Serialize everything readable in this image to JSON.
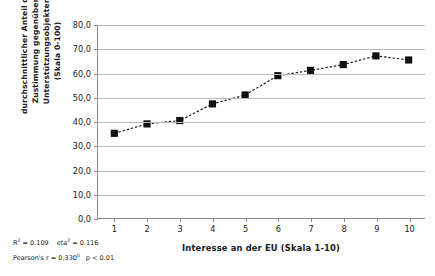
{
  "chart_data": {
    "type": "line",
    "title": "",
    "subtitle": "",
    "xlabel": "Interesse an der EU (Skala 1-10)",
    "ylabel": "durchschnittlicher Anteil der Zustimmung gegenüber Unterstützungsobjekten (Skala 0-100)",
    "ylabel_lines": [
      "durchschnittlicher Anteil der",
      "Zustimmung gegenüber",
      "Unterstützungsobjekten",
      "(Skala 0-100)"
    ],
    "categories": [
      "1",
      "2",
      "3",
      "4",
      "5",
      "6",
      "7",
      "8",
      "9",
      "10"
    ],
    "x": [
      1,
      2,
      3,
      4,
      5,
      6,
      7,
      8,
      9,
      10
    ],
    "values": [
      35.1,
      39.0,
      40.4,
      47.3,
      51.0,
      59.0,
      61.2,
      63.6,
      67.2,
      65.5
    ],
    "xlim": [
      0.5,
      10.5
    ],
    "ylim": [
      0,
      80
    ],
    "ytick_values": [
      0,
      10,
      20,
      30,
      40,
      50,
      60,
      70,
      80
    ],
    "ytick_labels": [
      "0,0",
      "10,0",
      "20,0",
      "30,0",
      "40,0",
      "50,0",
      "60,0",
      "70,0",
      "80,0"
    ],
    "xtick_labels": [
      "1",
      "2",
      "3",
      "4",
      "5",
      "6",
      "7",
      "8",
      "9",
      "10"
    ],
    "grid": "horizontal",
    "legend": "none",
    "marker": "square",
    "marker_color": "#111111",
    "line_style": "dashed",
    "line_color": "#111111"
  },
  "stats": {
    "r_squared_label": "R",
    "r_squared_sup": "2",
    "r_squared_value": "= 0.109",
    "eta_label": "eta",
    "eta_sup": "2",
    "eta_value": "= 0.116",
    "pearson_label": "Pearson's r = 0,330",
    "pearson_sup": "b",
    "p_value": "p < 0.01"
  },
  "colors": {
    "grid": "#b9b9b9",
    "axis": "#8a8a8a",
    "data": "#111111",
    "text": "#1a1a1a",
    "background": "#ffffff"
  }
}
